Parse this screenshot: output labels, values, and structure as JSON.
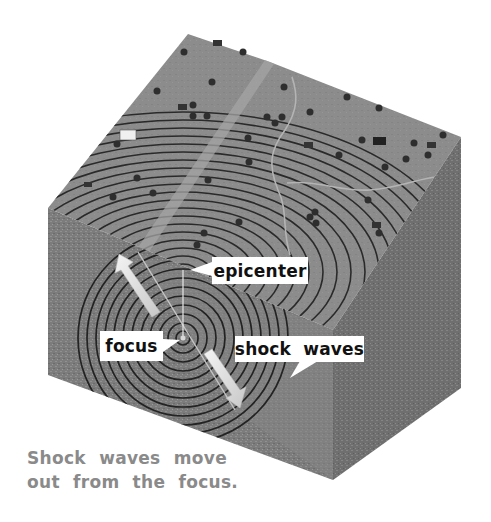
{
  "diagram": {
    "labels": {
      "epicenter": "epicenter",
      "focus": "focus",
      "shock_waves": "shock waves"
    },
    "caption": {
      "line1": "Shock waves move",
      "line2": "out from the focus."
    },
    "colors": {
      "background": "#ffffff",
      "ground_top": "#8c8c8c",
      "ground_front": "#7a7a7a",
      "ground_side": "#6e6e6e",
      "wave_lines": "#2a2a2a",
      "stream": "#b4b4b4",
      "arrow": "#e2e2e2",
      "label_bg": "#ffffff",
      "label_text": "#111111",
      "caption_text": "#8a8a8a"
    },
    "elements": {
      "focus_point": [
        183,
        338
      ],
      "epicenter_point": [
        183,
        270
      ],
      "arrows": [
        "up-left arrow from focus",
        "down-right arrow from focus"
      ],
      "features": [
        "houses",
        "trees",
        "streams",
        "fault line"
      ]
    }
  }
}
